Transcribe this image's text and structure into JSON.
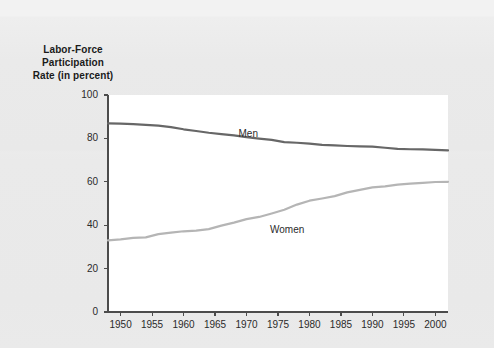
{
  "chart_data": {
    "type": "line",
    "title": "Labor-Force Participation Rate (in percent)",
    "title_lines": [
      "Labor-Force",
      "Participation",
      "Rate (in percent)"
    ],
    "xlabel": "",
    "ylabel": "Labor-Force Participation Rate (in percent)",
    "xlim": [
      1948,
      2002
    ],
    "ylim": [
      0,
      100
    ],
    "ytick_values": [
      0,
      20,
      40,
      60,
      80,
      100
    ],
    "ytick_labels": [
      "0",
      "20",
      "40",
      "60",
      "80",
      "100"
    ],
    "xtick_values": [
      1950,
      1955,
      1960,
      1965,
      1970,
      1975,
      1980,
      1985,
      1990,
      1995,
      2000
    ],
    "xtick_labels": [
      "1950",
      "1955",
      "1960",
      "1965",
      "1970",
      "1975",
      "1980",
      "1985",
      "1990",
      "1995",
      "2000"
    ],
    "grid": false,
    "legend_position": "inline-annotation",
    "plot_background": "#ffffff",
    "page_background": "#eaeaea",
    "x": [
      1948,
      1950,
      1952,
      1954,
      1956,
      1958,
      1960,
      1962,
      1964,
      1966,
      1968,
      1970,
      1972,
      1974,
      1976,
      1978,
      1980,
      1982,
      1984,
      1986,
      1988,
      1990,
      1992,
      1994,
      1996,
      1998,
      2000,
      2002
    ],
    "series": [
      {
        "name": "Men",
        "color": "#676767",
        "label_x": 1970,
        "label_y": 82,
        "values": [
          86.9,
          86.8,
          86.6,
          86.2,
          85.9,
          85.2,
          84.2,
          83.4,
          82.6,
          82.0,
          81.4,
          80.6,
          79.9,
          79.3,
          78.3,
          78.0,
          77.6,
          77.0,
          76.8,
          76.5,
          76.3,
          76.2,
          75.7,
          75.2,
          75.0,
          74.9,
          74.7,
          74.5
        ]
      },
      {
        "name": "Women",
        "color": "#b5b5b5",
        "label_x": 1975,
        "label_y": 38,
        "values": [
          33.0,
          33.5,
          34.2,
          34.4,
          35.9,
          36.6,
          37.2,
          37.5,
          38.2,
          39.8,
          41.2,
          42.8,
          43.8,
          45.4,
          47.1,
          49.5,
          51.3,
          52.3,
          53.4,
          55.1,
          56.3,
          57.4,
          57.9,
          58.7,
          59.2,
          59.5,
          59.9,
          60.0
        ]
      }
    ]
  }
}
